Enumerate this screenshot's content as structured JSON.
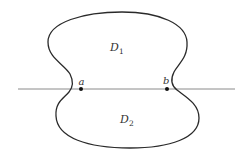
{
  "diagram": {
    "regions": [
      {
        "id": "D1",
        "label": "D",
        "subscript": "1",
        "position": "upper"
      },
      {
        "id": "D2",
        "label": "D",
        "subscript": "2",
        "position": "lower"
      }
    ],
    "points": [
      {
        "id": "a",
        "label": "a",
        "x": 81,
        "y": 89
      },
      {
        "id": "b",
        "label": "b",
        "x": 167,
        "y": 89
      }
    ],
    "line": {
      "x1": 18,
      "y1": 89,
      "x2": 235,
      "y2": 89
    },
    "colors": {
      "curve": "#2a2a2a",
      "line": "#8a8a8a",
      "points": "#111111",
      "text": "#333333",
      "background": "#ffffff"
    }
  }
}
